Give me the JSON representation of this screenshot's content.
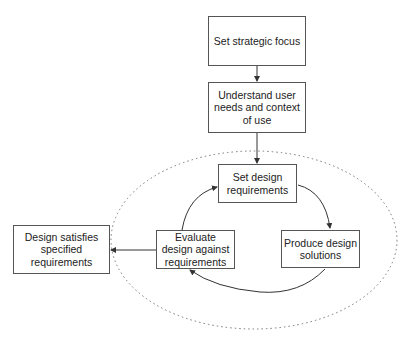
{
  "diagram": {
    "nodes": [
      {
        "id": "strategic",
        "label": "Set strategic focus"
      },
      {
        "id": "understand",
        "label": "Understand user needs and context of use"
      },
      {
        "id": "setreq",
        "label": "Set design requirements"
      },
      {
        "id": "produce",
        "label": "Produce design solutions"
      },
      {
        "id": "evaluate",
        "label": "Evaluate design against requirements"
      },
      {
        "id": "satisfies",
        "label": "Design satisfies specified requirements"
      }
    ],
    "edges": [
      {
        "from": "strategic",
        "to": "understand"
      },
      {
        "from": "understand",
        "to": "setreq"
      },
      {
        "from": "setreq",
        "to": "produce"
      },
      {
        "from": "produce",
        "to": "evaluate"
      },
      {
        "from": "evaluate",
        "to": "setreq"
      },
      {
        "from": "evaluate",
        "to": "satisfies"
      }
    ],
    "loop_boundary": "dotted ellipse"
  }
}
